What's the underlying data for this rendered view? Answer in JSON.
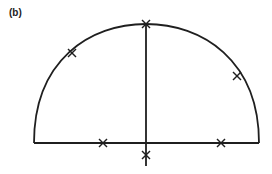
{
  "figure": {
    "panel_label": "(b)",
    "stroke_color": "#1f1f1f",
    "shape": "semicircle with diameter baseline and vertical radius",
    "markers": [
      {
        "name": "arc-upper-left",
        "x": 72,
        "y": 53
      },
      {
        "name": "arc-top",
        "x": 146,
        "y": 24
      },
      {
        "name": "arc-right",
        "x": 237,
        "y": 76
      },
      {
        "name": "base-left",
        "x": 103,
        "y": 143
      },
      {
        "name": "base-right",
        "x": 221,
        "y": 143
      },
      {
        "name": "below-base",
        "x": 146,
        "y": 155
      }
    ]
  }
}
